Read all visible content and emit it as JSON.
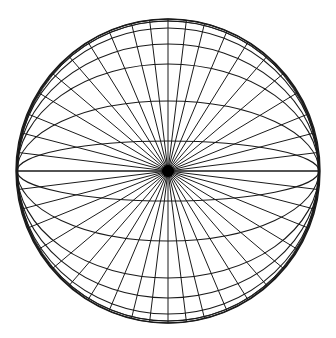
{
  "figure": {
    "stroke_color": "#1a1a1a",
    "background": "#ffffff",
    "center": [
      168,
      171
    ],
    "radius_x": 151,
    "radius_y": 152,
    "pole_dot_radius": 6,
    "ellipse_ry": [
      152,
      150,
      143,
      127,
      107,
      70,
      30
    ],
    "radial_angles_deg_from_horizontal": [
      0,
      7,
      14.5,
      22,
      31,
      40,
      49,
      58,
      67,
      76,
      83,
      90
    ]
  }
}
